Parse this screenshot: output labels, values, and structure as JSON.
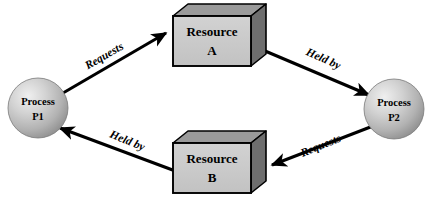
{
  "diagram": {
    "canvas": {
      "width": 431,
      "height": 206,
      "background": "#ffffff"
    },
    "palette": {
      "box_front": "#c9c9c9",
      "box_top": "#9a9a9a",
      "box_side": "#6e6e6e",
      "box_outline": "#000000",
      "circle_light": "#e8e8e8",
      "circle_mid": "#bdbdbd",
      "circle_dark": "#8e8e8e",
      "circle_outline": "#6a6a6a",
      "arrow": "#000000",
      "text": "#000000"
    },
    "nodes": [
      {
        "id": "p1",
        "type": "process-circle",
        "line1": "Process",
        "line2": "P1",
        "cx": 38,
        "cy": 108,
        "r": 30
      },
      {
        "id": "p2",
        "type": "process-circle",
        "line1": "Process",
        "line2": "P2",
        "cx": 394,
        "cy": 109,
        "r": 30
      },
      {
        "id": "ra",
        "type": "resource-box",
        "line1": "Resource",
        "line2": "A",
        "x": 173,
        "y": 16,
        "width": 78,
        "height": 50,
        "depth": 15
      },
      {
        "id": "rb",
        "type": "resource-box",
        "line1": "Resource",
        "line2": "B",
        "x": 173,
        "y": 143,
        "width": 78,
        "height": 50,
        "depth": 15
      }
    ],
    "edges": [
      {
        "id": "p1-requests-ra",
        "label": "Requests",
        "from": "p1",
        "to": "ra",
        "x1": 63,
        "y1": 93,
        "x2": 168,
        "y2": 32,
        "label_x": 106,
        "label_y": 59,
        "label_rotate": -30
      },
      {
        "id": "ra-heldby-p2",
        "label": "Held by",
        "from": "ra",
        "to": "p2",
        "x1": 258,
        "y1": 48,
        "x2": 371,
        "y2": 96,
        "label_x": 322,
        "label_y": 62,
        "label_rotate": 24
      },
      {
        "id": "p2-requests-rb",
        "label": "Requests",
        "from": "p2",
        "to": "rb",
        "x1": 373,
        "y1": 126,
        "x2": 270,
        "y2": 166,
        "label_x": 322,
        "label_y": 149,
        "label_rotate": -22
      },
      {
        "id": "rb-heldby-p1",
        "label": "Held by",
        "from": "rb",
        "to": "p1",
        "x1": 178,
        "y1": 172,
        "x2": 58,
        "y2": 127,
        "label_x": 126,
        "label_y": 144,
        "label_rotate": 22
      }
    ]
  }
}
